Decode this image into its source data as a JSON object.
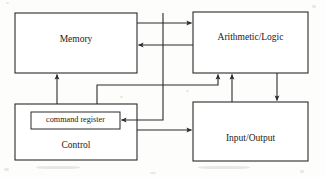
{
  "diagram": {
    "type": "block-diagram",
    "title": "",
    "stroke_color": "#2b2b2b",
    "fill_color": "#ffffff",
    "background_color": "#fdfdfb",
    "nodes": [
      {
        "id": "memory",
        "label": "Memory",
        "x": 15,
        "y": 13,
        "w": 122,
        "h": 60,
        "label_x": 76,
        "label_y": 40
      },
      {
        "id": "arithmetic-logic",
        "label": "Arithmetic/Logic",
        "x": 193,
        "y": 12,
        "w": 115,
        "h": 61,
        "label_x": 250,
        "label_y": 38
      },
      {
        "id": "control",
        "label": "Control",
        "x": 15,
        "y": 104,
        "w": 122,
        "h": 56,
        "label_x": 76,
        "label_y": 147
      },
      {
        "id": "input-output",
        "label": "Input/Output",
        "x": 193,
        "y": 102,
        "w": 115,
        "h": 59,
        "label_x": 250,
        "label_y": 139
      },
      {
        "id": "command-register",
        "label": "command register",
        "x": 31,
        "y": 112,
        "w": 89,
        "h": 17,
        "label_x": 75,
        "label_y": 120
      }
    ],
    "edges": [
      {
        "id": "memory-to-alu",
        "from": "memory",
        "to": "arithmetic-logic",
        "direction": "right"
      },
      {
        "id": "alu-to-memory",
        "from": "arithmetic-logic",
        "to": "memory",
        "direction": "left"
      },
      {
        "id": "control-to-memory",
        "from": "control",
        "to": "memory",
        "direction": "up"
      },
      {
        "id": "control-to-alu",
        "from": "control",
        "to": "arithmetic-logic",
        "direction": "up"
      },
      {
        "id": "memory-to-command-register",
        "from": "memory",
        "to": "command-register",
        "direction": "left"
      },
      {
        "id": "control-to-input-output",
        "from": "control",
        "to": "input-output",
        "direction": "right"
      },
      {
        "id": "input-output-to-alu",
        "from": "input-output",
        "to": "arithmetic-logic",
        "direction": "up"
      },
      {
        "id": "alu-to-input-output",
        "from": "arithmetic-logic",
        "to": "input-output",
        "direction": "down"
      }
    ]
  }
}
